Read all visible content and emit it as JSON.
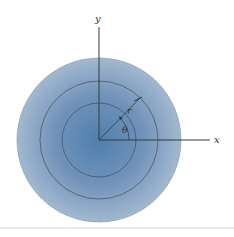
{
  "diagram": {
    "type": "polar-coordinates-disk",
    "labels": {
      "y_axis": "y",
      "x_axis": "x",
      "radius": "r",
      "angle": "θ"
    },
    "colors": {
      "disk_center": "#4f7fae",
      "disk_edge": "#9db3cd",
      "circle_stroke": "#3d4f63",
      "axis_stroke": "#2e3a47",
      "separator": "#d9d9d9"
    },
    "circles": [
      {
        "name": "outer",
        "radius": 82
      },
      {
        "name": "middle",
        "radius": 59
      },
      {
        "name": "inner",
        "radius": 37
      }
    ]
  }
}
